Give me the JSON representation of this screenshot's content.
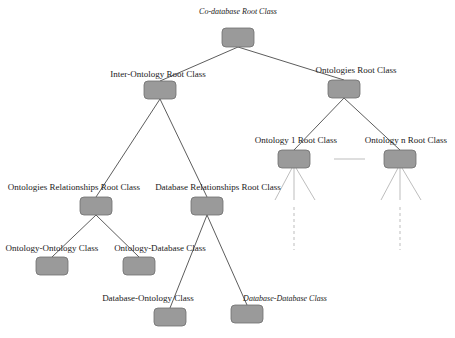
{
  "diagram": {
    "colors": {
      "box_fill": "#9a9a9a",
      "box_stroke": "#6e6e6e",
      "edge": "#4a4a4a",
      "edge_light": "#b5b5b5"
    },
    "nodes": {
      "root": {
        "label": "Co-database Root Class",
        "italic": true
      },
      "inter_ontology": {
        "label": "Inter-Ontology Root Class"
      },
      "ontologies": {
        "label": "Ontologies Root Class"
      },
      "ontology_1": {
        "label": "Ontology 1 Root Class"
      },
      "ontology_n": {
        "label": "Ontology n Root Class"
      },
      "ontologies_relationships": {
        "label": "Ontologies Relationships Root Class"
      },
      "database_relationships": {
        "label": "Database Relationships Root Class"
      },
      "ontology_ontology": {
        "label": "Ontology-Ontology Class"
      },
      "ontology_database": {
        "label": "Ontology-Database Class"
      },
      "database_ontology": {
        "label": "Database-Ontology Class"
      },
      "database_database": {
        "label": "Database-Database Class",
        "italic": true
      }
    },
    "edges": [
      [
        "root",
        "inter_ontology"
      ],
      [
        "root",
        "ontologies"
      ],
      [
        "ontologies",
        "ontology_1"
      ],
      [
        "ontologies",
        "ontology_n"
      ],
      [
        "inter_ontology",
        "ontologies_relationships"
      ],
      [
        "inter_ontology",
        "database_relationships"
      ],
      [
        "ontologies_relationships",
        "ontology_ontology"
      ],
      [
        "ontologies_relationships",
        "ontology_database"
      ],
      [
        "database_relationships",
        "database_ontology"
      ],
      [
        "database_relationships",
        "database_database"
      ]
    ],
    "ellipsis_between": [
      "ontology_1",
      "ontology_n"
    ]
  }
}
